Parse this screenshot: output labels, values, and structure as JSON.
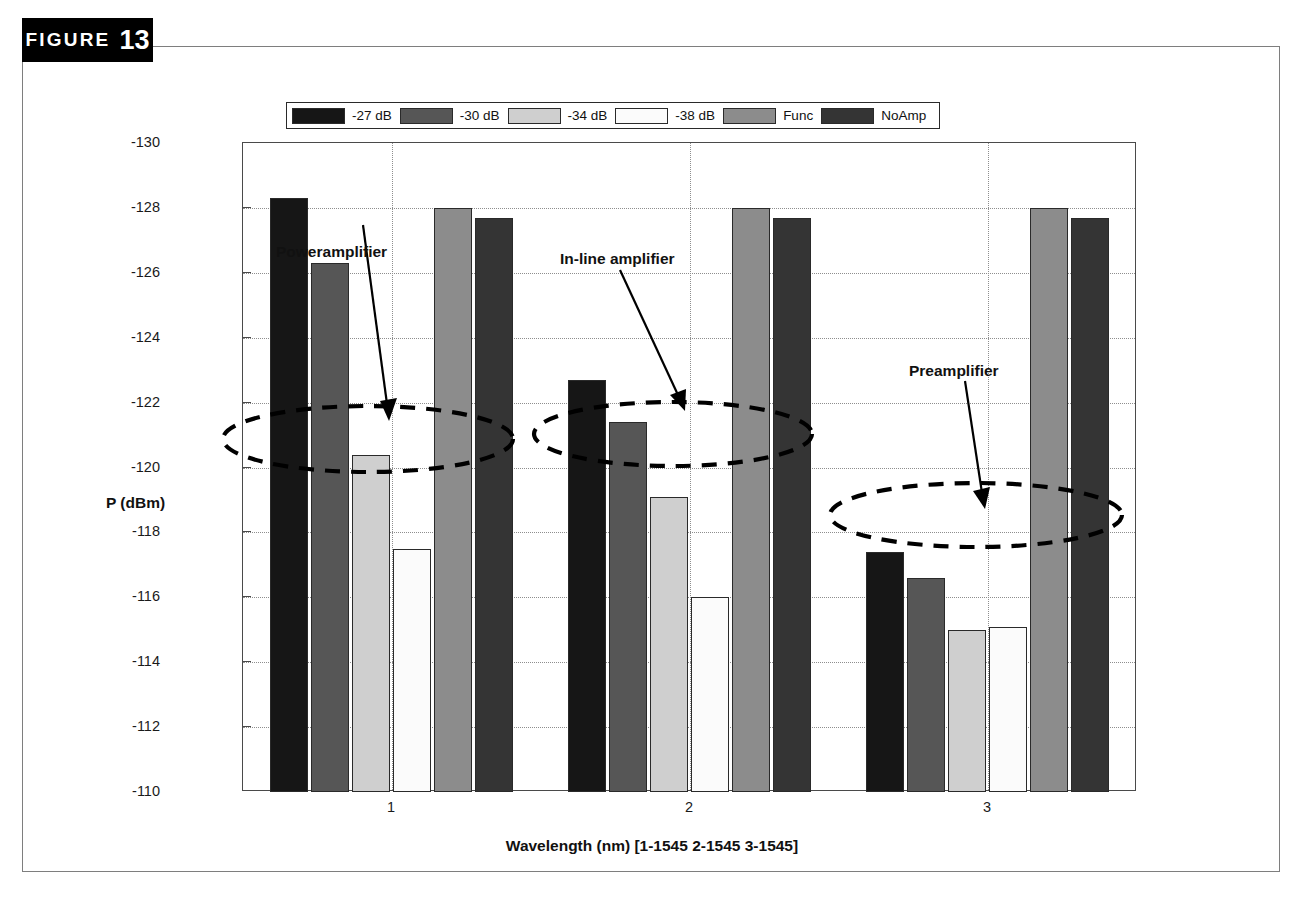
{
  "figure": {
    "label_word": "FIGURE",
    "number": "13"
  },
  "chart_data": {
    "type": "bar",
    "title": "Comparsion of phase noise energies for PW-amp, In-amp, PR-amp at 1545 nm",
    "xlabel": "Wavelength (nm) [1-1545  2-1545  3-1545]",
    "ylabel": "P (dBm)",
    "categories": [
      "1",
      "2",
      "3"
    ],
    "ylim": [
      -130,
      -110
    ],
    "y_axis_inverted": true,
    "yticks": [
      -130,
      -128,
      -126,
      -124,
      -122,
      -120,
      -118,
      -116,
      -114,
      -112,
      -110
    ],
    "ytick_labels": [
      "-130",
      "-128",
      "-126",
      "-124",
      "-122",
      "-120",
      "-118",
      "-116",
      "-114",
      "-112",
      "-110"
    ],
    "grid": true,
    "legend_position": "top-center",
    "series": [
      {
        "name": "-27 dB",
        "color": "#161616",
        "values": [
          -128.3,
          -122.7,
          -117.4
        ]
      },
      {
        "name": "-30 dB",
        "color": "#565656",
        "values": [
          -126.3,
          -121.4,
          -116.6
        ]
      },
      {
        "name": "-34 dB",
        "color": "#cfcfcf",
        "values": [
          -120.4,
          -119.1,
          -115.0
        ]
      },
      {
        "name": "-38 dB",
        "color": "#fbfbfb",
        "values": [
          -117.5,
          -116.0,
          -115.1
        ]
      },
      {
        "name": "Func",
        "color": "#8c8c8c",
        "values": [
          -128.0,
          -128.0,
          -128.0
        ]
      },
      {
        "name": "NoAmp",
        "color": "#343434",
        "values": [
          -127.7,
          -127.7,
          -127.7
        ]
      }
    ],
    "annotations": [
      {
        "label": "Poweramplifier",
        "target_series": "-34 dB",
        "target_group": "1"
      },
      {
        "label": "In-line amplifier",
        "target_series": "-34 dB",
        "target_group": "2"
      },
      {
        "label": "Preamplifier",
        "target_series": "-34 dB",
        "target_group": "3"
      }
    ]
  }
}
